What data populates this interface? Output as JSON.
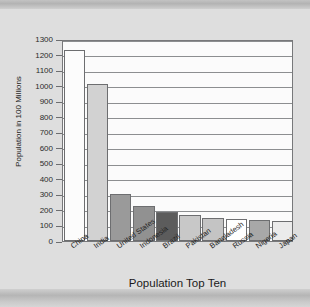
{
  "chart_data": {
    "type": "bar",
    "title": "",
    "xlabel": "Population Top Ten",
    "ylabel": "Population in 100 Millions",
    "categories": [
      "China",
      "India",
      "United States",
      "Indonesia",
      "Brazil",
      "Pakistan",
      "Bangladesh",
      "Russia",
      "Nigeria",
      "Japan"
    ],
    "values": [
      1230,
      1010,
      300,
      225,
      185,
      165,
      150,
      142,
      135,
      128
    ],
    "ylim": [
      0,
      1300
    ],
    "ytick_step": 100,
    "yticks": [
      0,
      100,
      200,
      300,
      400,
      500,
      600,
      700,
      800,
      900,
      1000,
      1100,
      1200,
      1300
    ],
    "ytick_labels": [
      "0",
      "100",
      "200",
      "300",
      "400",
      "500",
      "600",
      "700",
      "800",
      "900",
      "1000",
      "1100",
      "1200",
      "1300"
    ],
    "grid": true,
    "legend": false,
    "bar_colors": [
      "#fcfcfc",
      "#d2d2d2",
      "#9a9a9a",
      "#919191",
      "#5c5c5c",
      "#c8c8c8",
      "#c4c4c4",
      "#ffffff",
      "#a8a8a8",
      "#ebebeb"
    ],
    "bar_border_color": "#6d6e70",
    "plot_background": "#fbfbfb",
    "gridline_color": "#8c8e90",
    "page_background": "#dedede"
  }
}
